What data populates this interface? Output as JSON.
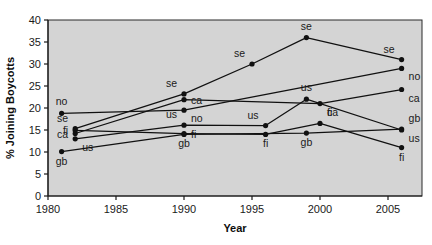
{
  "chart_data": {
    "type": "line",
    "title": "",
    "xlabel": "Year",
    "ylabel": "% Joining Boycotts",
    "xlim": [
      1980,
      2007.5
    ],
    "ylim": [
      0,
      40
    ],
    "grid": false,
    "legend_position": "none",
    "xticks": [
      1980,
      1985,
      1990,
      1995,
      2000,
      2005
    ],
    "xtick_labels": [
      "1980",
      "1985",
      "1990",
      "1995",
      "2000",
      "2005"
    ],
    "yticks": [
      0,
      5,
      10,
      15,
      20,
      25,
      30,
      35,
      40
    ],
    "ytick_labels": [
      "0",
      "5",
      "10",
      "15",
      "20",
      "25",
      "30",
      "35",
      "40"
    ],
    "point_marker": "filled-circle",
    "series": [
      {
        "name": "se",
        "label": "se",
        "x": [
          1982,
          1990,
          1995,
          1999,
          2006
        ],
        "values": [
          15.3,
          23.2,
          30.0,
          36.0,
          31.0
        ],
        "point_labels": [
          "se",
          "se",
          "se",
          "se",
          "se"
        ],
        "label_positions": [
          "above-left",
          "above-left",
          "above-left",
          "above",
          "above-left"
        ]
      },
      {
        "name": "no",
        "label": "no",
        "x": [
          1981,
          1990,
          2006
        ],
        "values": [
          18.8,
          19.5,
          29.0
        ],
        "point_labels": [
          "no",
          "no",
          "no"
        ],
        "label_positions": [
          "above",
          "below-right",
          "below-right"
        ]
      },
      {
        "name": "ca",
        "label": "ca",
        "x": [
          1982,
          1990,
          2000,
          2006
        ],
        "values": [
          14.2,
          21.9,
          21.0,
          24.2
        ],
        "point_labels": [
          "ca",
          "ca",
          "ca",
          "ca"
        ],
        "label_positions": [
          "left",
          "right",
          "below-right",
          "below-right"
        ]
      },
      {
        "name": "us",
        "label": "us",
        "x": [
          1982,
          1990,
          1996,
          1999,
          2006
        ],
        "values": [
          13.0,
          16.1,
          16.0,
          22.0,
          15.0
        ],
        "point_labels": [
          "us",
          "us",
          "us",
          "us",
          "us"
        ],
        "label_positions": [
          "below-right",
          "above-left",
          "above-left",
          "above",
          "below-right"
        ]
      },
      {
        "name": "fi",
        "label": "fi",
        "x": [
          1982,
          1990,
          1996,
          2000,
          2006
        ],
        "values": [
          14.9,
          14.2,
          14.0,
          16.5,
          11.0
        ],
        "point_labels": [
          "fi",
          "fi",
          "fi",
          "fi",
          "fi"
        ],
        "label_positions": [
          "left",
          "right",
          "below",
          "above-right",
          "below"
        ]
      },
      {
        "name": "gb",
        "label": "gb",
        "x": [
          1981,
          1990,
          1999,
          2006
        ],
        "values": [
          10.1,
          14.0,
          14.3,
          15.2
        ],
        "point_labels": [
          "gb",
          "gb",
          "gb",
          "gb"
        ],
        "label_positions": [
          "below",
          "below",
          "below",
          "above-right"
        ]
      }
    ]
  }
}
